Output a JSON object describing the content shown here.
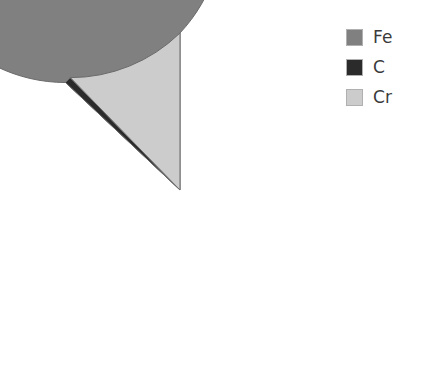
{
  "chart_data": {
    "type": "pie",
    "title": "",
    "subtitle": "",
    "xlabel": "",
    "ylabel": "",
    "grid": false,
    "legend_position": "right",
    "start_angle_deg": 0,
    "direction": "counterclockwise",
    "categories": [
      "Fe",
      "C",
      "Cr"
    ],
    "values": [
      87.0,
      0.7,
      12.3
    ],
    "unit": "%",
    "slices": [
      {
        "label": "Fe",
        "value": 87.0,
        "color": "#808080",
        "start_angle_deg": 0,
        "end_angle_deg": 313.2
      },
      {
        "label": "C",
        "value": 0.7,
        "color": "#2b2b2b",
        "start_angle_deg": 313.2,
        "end_angle_deg": 315.7
      },
      {
        "label": "Cr",
        "value": 12.3,
        "color": "#cccccc",
        "start_angle_deg": 315.7,
        "end_angle_deg": 360
      }
    ]
  },
  "geometry": {
    "center_x": 180,
    "center_y": 190,
    "radius": 157,
    "edge_color": "#6b6b6b",
    "edge_width": 1
  },
  "legend": {
    "items": [
      {
        "label": "Fe",
        "color": "#808080",
        "swatch_name": "legend-swatch-fe"
      },
      {
        "label": "C",
        "color": "#2b2b2b",
        "swatch_name": "legend-swatch-c"
      },
      {
        "label": "Cr",
        "color": "#cccccc",
        "swatch_name": "legend-swatch-cr"
      }
    ]
  },
  "colors": {
    "background": "#ffffff",
    "fe": "#808080",
    "c": "#2b2b2b",
    "cr": "#cccccc",
    "text": "#3a3a3a",
    "outline": "#6b6b6b"
  }
}
